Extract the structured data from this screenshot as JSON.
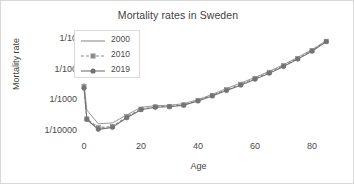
{
  "chart_data": {
    "type": "line",
    "title": "Mortality rates in Sweden",
    "xlabel": "Age",
    "ylabel": "Mortality rate",
    "yscale": "log",
    "ylim": [
      5e-05,
      0.2
    ],
    "xlim": [
      -2,
      90
    ],
    "grid": false,
    "legend_position": "upper-left-inside",
    "ytick_labels": [
      "1/10",
      "1/100",
      "1/1000",
      "1/10000"
    ],
    "ytick_values": [
      0.1,
      0.01,
      0.001,
      0.0001
    ],
    "xtick_labels": [
      "0",
      "20",
      "40",
      "60",
      "80"
    ],
    "xtick_values": [
      0,
      20,
      40,
      60,
      80
    ],
    "x": [
      0,
      1,
      5,
      10,
      15,
      20,
      25,
      30,
      35,
      40,
      45,
      50,
      55,
      60,
      65,
      70,
      75,
      80,
      85
    ],
    "series": [
      {
        "name": "2000",
        "marker": "none",
        "dash": "solid",
        "color": "#8c8c8c",
        "values": [
          0.0034,
          0.00045,
          0.00016,
          0.00017,
          0.00031,
          0.00055,
          0.00062,
          0.00064,
          0.00072,
          0.00098,
          0.00145,
          0.00225,
          0.0034,
          0.0052,
          0.0082,
          0.0135,
          0.0235,
          0.042,
          0.082
        ]
      },
      {
        "name": "2010",
        "marker": "square",
        "dash": "dashed",
        "color": "#8c8c8c",
        "values": [
          0.0026,
          0.00023,
          0.00012,
          0.00013,
          0.00027,
          0.00048,
          0.00057,
          0.00059,
          0.00066,
          0.00092,
          0.00135,
          0.00205,
          0.0031,
          0.0048,
          0.0076,
          0.0125,
          0.0215,
          0.039,
          0.078
        ]
      },
      {
        "name": "2019",
        "marker": "circle",
        "dash": "solid",
        "color": "#737373",
        "values": [
          0.0023,
          0.00022,
          0.000105,
          0.000122,
          0.00025,
          0.00046,
          0.00055,
          0.00057,
          0.00064,
          0.00088,
          0.00128,
          0.00195,
          0.0029,
          0.0045,
          0.0071,
          0.0118,
          0.0205,
          0.037,
          0.076
        ]
      }
    ]
  },
  "axes": {
    "title": "Mortality rates in Sweden",
    "xlabel": "Age",
    "ylabel": "Mortality rate"
  }
}
